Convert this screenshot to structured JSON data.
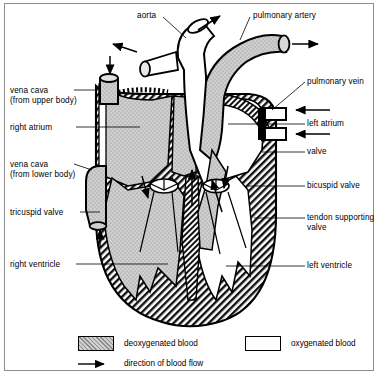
{
  "diagram": {
    "frame_color": "#8d8d8d",
    "labels_left": [
      {
        "id": "vena-cava-upper",
        "text": "vena cava\n(from upper body)",
        "x": 10,
        "y": 86
      },
      {
        "id": "right-atrium",
        "text": "right atrium",
        "x": 10,
        "y": 123
      },
      {
        "id": "vena-cava-lower",
        "text": "vena cava\n(from lower body)",
        "x": 10,
        "y": 160
      },
      {
        "id": "tricuspid-valve",
        "text": "tricuspid valve",
        "x": 10,
        "y": 208
      },
      {
        "id": "right-ventricle",
        "text": "right ventricle",
        "x": 10,
        "y": 260
      }
    ],
    "labels_right": [
      {
        "id": "pulmonary-vein",
        "text": "pulmonary vein",
        "x": 307,
        "y": 80
      },
      {
        "id": "left-atrium",
        "text": "left atrium",
        "x": 307,
        "y": 120
      },
      {
        "id": "valve",
        "text": "valve",
        "x": 307,
        "y": 148
      },
      {
        "id": "bicuspid-valve",
        "text": "bicuspid valve",
        "x": 307,
        "y": 182
      },
      {
        "id": "tendon-supporting-valve",
        "text": "tendon supporting\nvalve",
        "x": 307,
        "y": 214
      },
      {
        "id": "left-ventricle",
        "text": "left ventricle",
        "x": 307,
        "y": 262
      }
    ],
    "labels_top": [
      {
        "id": "aorta",
        "text": "aorta",
        "x": 137,
        "y": 11
      },
      {
        "id": "pulmonary-artery",
        "text": "pulmonary artery",
        "x": 253,
        "y": 11
      }
    ],
    "legend": [
      {
        "id": "deoxygenated",
        "label": "deoxygenated blood",
        "swatch": "stipple",
        "color": "#cfcfcf"
      },
      {
        "id": "oxygenated",
        "label": "oxygenated blood",
        "swatch": "white",
        "color": "#ffffff"
      },
      {
        "id": "flow",
        "label": "direction of blood flow",
        "swatch": "arrow",
        "color": "#000000"
      }
    ],
    "colors": {
      "deoxygenated_fill": "#cfcfcf",
      "oxygenated_fill": "#ffffff",
      "muscle_hatch": "#000000",
      "outline": "#000000"
    }
  }
}
